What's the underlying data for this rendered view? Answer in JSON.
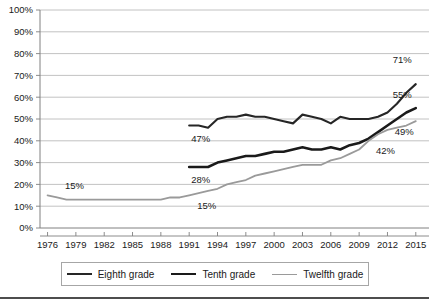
{
  "chart_data": {
    "type": "line",
    "title": "",
    "subtitle": "",
    "xlabel": "",
    "ylabel": "",
    "xlim": [
      1975,
      2016
    ],
    "ylim": [
      0,
      100
    ],
    "grid": true,
    "legend_position": "bottom",
    "y_ticks": [
      "0%",
      "10%",
      "20%",
      "30%",
      "40%",
      "50%",
      "60%",
      "70%",
      "80%",
      "90%",
      "100%"
    ],
    "y_tick_values": [
      0,
      10,
      20,
      30,
      40,
      50,
      60,
      70,
      80,
      90,
      100
    ],
    "x_ticks": [
      "1976",
      "1979",
      "1982",
      "1985",
      "1988",
      "1991",
      "1994",
      "1997",
      "2000",
      "2003",
      "2006",
      "2009",
      "2012",
      "2015"
    ],
    "x_tick_values": [
      1976,
      1979,
      1982,
      1985,
      1988,
      1991,
      1994,
      1997,
      2000,
      2003,
      2006,
      2009,
      2012,
      2015
    ],
    "series": [
      {
        "name": "Eighth grade",
        "color": "#262626",
        "x": [
          1991,
          1992,
          1993,
          1994,
          1995,
          1996,
          1997,
          1998,
          1999,
          2000,
          2001,
          2002,
          2003,
          2004,
          2005,
          2006,
          2007,
          2008,
          2009,
          2010,
          2011,
          2012,
          2013,
          2014,
          2015
        ],
        "values": [
          47,
          47,
          46,
          50,
          51,
          51,
          52,
          51,
          51,
          50,
          49,
          48,
          52,
          51,
          50,
          48,
          51,
          50,
          50,
          50,
          51,
          53,
          57,
          62,
          66
        ]
      },
      {
        "name": "Tenth grade",
        "color": "#1a1a1a",
        "x": [
          1991,
          1992,
          1993,
          1994,
          1995,
          1996,
          1997,
          1998,
          1999,
          2000,
          2001,
          2002,
          2003,
          2004,
          2005,
          2006,
          2007,
          2008,
          2009,
          2010,
          2011,
          2012,
          2013,
          2014,
          2015
        ],
        "values": [
          28,
          28,
          28,
          30,
          31,
          32,
          33,
          33,
          34,
          35,
          35,
          36,
          37,
          36,
          36,
          37,
          36,
          38,
          39,
          41,
          44,
          47,
          50,
          53,
          55
        ]
      },
      {
        "name": "Twelfth grade",
        "color": "#9a9a9a",
        "x": [
          1976,
          1977,
          1978,
          1979,
          1980,
          1981,
          1982,
          1983,
          1984,
          1985,
          1986,
          1987,
          1988,
          1989,
          1990,
          1991,
          1992,
          1993,
          1994,
          1995,
          1996,
          1997,
          1998,
          1999,
          2000,
          2001,
          2002,
          2003,
          2004,
          2005,
          2006,
          2007,
          2008,
          2009,
          2010,
          2011,
          2012,
          2013,
          2014,
          2015
        ],
        "values": [
          15,
          14,
          13,
          13,
          13,
          13,
          13,
          13,
          13,
          13,
          13,
          13,
          13,
          14,
          14,
          15,
          16,
          17,
          18,
          20,
          21,
          22,
          24,
          25,
          26,
          27,
          28,
          29,
          29,
          29,
          31,
          32,
          34,
          36,
          40,
          43,
          45,
          46,
          47,
          49
        ]
      }
    ],
    "annotations": [
      {
        "text": "15%",
        "series": "Twelfth grade",
        "x": 1977,
        "y": 15,
        "align": "start"
      },
      {
        "text": "47%",
        "series": "Eighth grade",
        "x": 1991,
        "y": 47,
        "align": "start"
      },
      {
        "text": "28%",
        "series": "Tenth grade",
        "x": 1991,
        "y": 28,
        "align": "start"
      },
      {
        "text": "15%",
        "series": "Twelfth grade",
        "x": 1991,
        "y": 15,
        "align": "start"
      },
      {
        "text": "71%",
        "series": "Eighth grade",
        "x": 2015,
        "y": 71,
        "align": "end"
      },
      {
        "text": "55%",
        "series": "Tenth grade",
        "x": 2015,
        "y": 55,
        "align": "end"
      },
      {
        "text": "42%",
        "series": "Twelfth grade",
        "x": 2013,
        "y": 42,
        "align": "end"
      },
      {
        "text": "49%",
        "series": "Twelfth grade",
        "x": 2015,
        "y": 49,
        "align": "end"
      }
    ]
  },
  "legend": {
    "items": [
      {
        "label": "Eighth grade"
      },
      {
        "label": "Tenth grade"
      },
      {
        "label": "Twelfth grade"
      }
    ]
  },
  "axis": {
    "y_label_0": "0%",
    "y_label_10": "10%",
    "y_label_20": "20%",
    "y_label_30": "30%",
    "y_label_40": "40%",
    "y_label_50": "50%",
    "y_label_60": "60%",
    "y_label_70": "70%",
    "y_label_80": "80%",
    "y_label_90": "90%",
    "y_label_100": "100%"
  }
}
